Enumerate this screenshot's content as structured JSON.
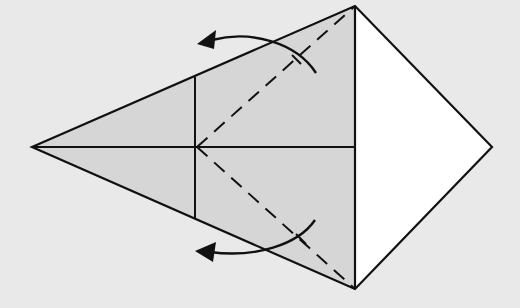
{
  "diagram": {
    "colors": {
      "background": "#e9e9e9",
      "shaded_paper": "#d6d6d6",
      "white_paper": "#ffffff",
      "line": "#111111"
    },
    "points": {
      "left_tip": [
        32,
        147
      ],
      "top": [
        355,
        6
      ],
      "bottom": [
        355,
        289
      ],
      "right_tip": [
        492,
        147
      ],
      "crease_center": [
        197,
        147
      ],
      "vertical_top": [
        195,
        77
      ],
      "vertical_bottom": [
        195,
        218
      ]
    },
    "elements": [
      {
        "name": "kite-shaded-left-region",
        "type": "polygon"
      },
      {
        "name": "white-right-triangle",
        "type": "polygon"
      },
      {
        "name": "center-horizontal-crease",
        "type": "line"
      },
      {
        "name": "vertical-crease",
        "type": "line"
      },
      {
        "name": "upper-dashed-valley-fold",
        "type": "dashed-line"
      },
      {
        "name": "lower-dashed-valley-fold",
        "type": "dashed-line"
      },
      {
        "name": "upper-fold-arrow",
        "type": "curved-arrow",
        "direction": "left"
      },
      {
        "name": "lower-fold-arrow",
        "type": "curved-arrow",
        "direction": "left"
      }
    ]
  }
}
